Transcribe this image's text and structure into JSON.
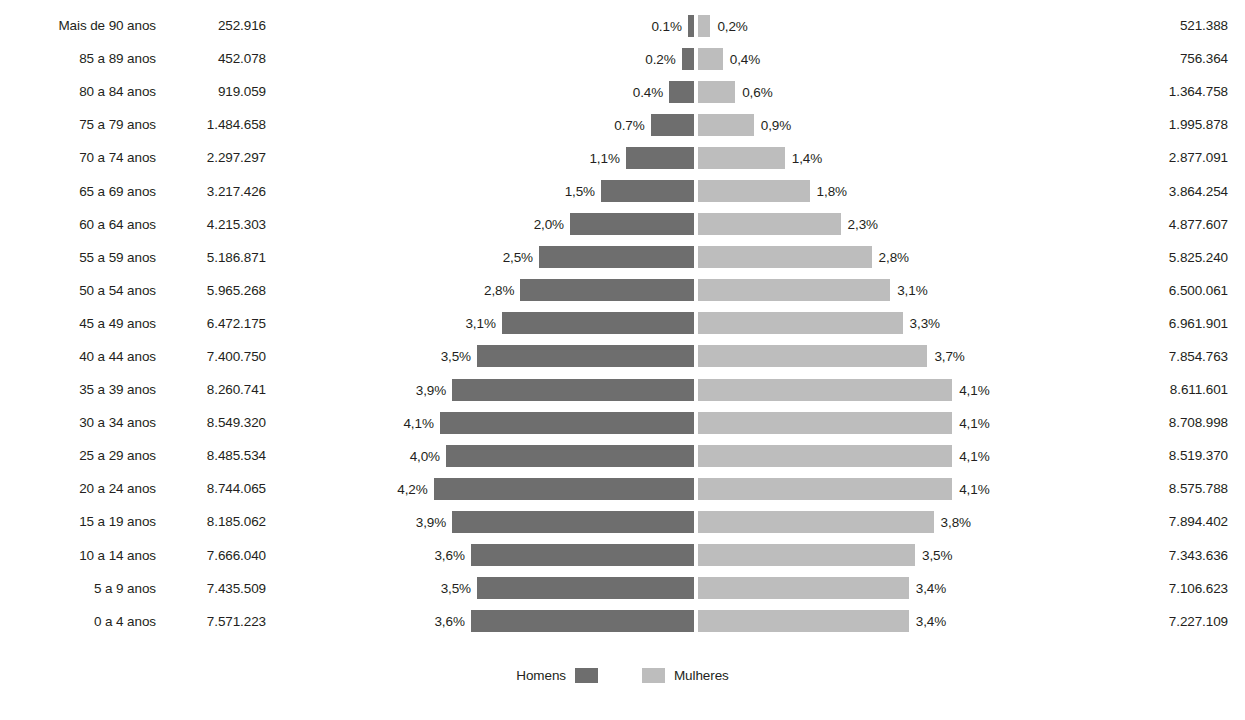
{
  "legend": {
    "men_label": "Homens",
    "women_label": "Mulheres",
    "men_color": "#6e6e6e",
    "women_color": "#bdbdbd"
  },
  "chart_data": {
    "type": "bar",
    "subtype": "population-pyramid",
    "title": "",
    "xlabel": "",
    "ylabel": "",
    "grid": false,
    "legend_position": "bottom-center",
    "center_axis_px": 696,
    "px_per_percent": 62.0,
    "xlim": [
      -4.5,
      4.5
    ],
    "categories": [
      "Mais de 90 anos",
      "85 a 89 anos",
      "80 a 84 anos",
      "75 a 79 anos",
      "70 a 74 anos",
      "65 a 69 anos",
      "60 a 64 anos",
      "55 a 59 anos",
      "50 a 54 anos",
      "45 a 49 anos",
      "40 a 44 anos",
      "35 a 39 anos",
      "30 a 34 anos",
      "25 a 29 anos",
      "20 a 24 anos",
      "15 a 19 anos",
      "10 a 14 anos",
      "5 a 9 anos",
      "0 a 4 anos"
    ],
    "series": [
      {
        "name": "Homens",
        "side": "left",
        "color": "#6e6e6e",
        "counts_text": [
          "252.916",
          "452.078",
          "919.059",
          "1.484.658",
          "2.297.297",
          "3.217.426",
          "4.215.303",
          "5.186.871",
          "5.965.268",
          "6.472.175",
          "7.400.750",
          "8.260.741",
          "8.549.320",
          "8.485.534",
          "8.744.065",
          "8.185.062",
          "7.666.040",
          "7.435.509",
          "7.571.223"
        ],
        "counts": [
          252916,
          452078,
          919059,
          1484658,
          2297297,
          3217426,
          4215303,
          5186871,
          5965268,
          6472175,
          7400750,
          8260741,
          8549320,
          8485534,
          8744065,
          8185062,
          7666040,
          7435509,
          7571223
        ],
        "percent_text": [
          "0.1%",
          "0.2%",
          "0.4%",
          "0.7%",
          "1,1%",
          "1,5%",
          "2,0%",
          "2,5%",
          "2,8%",
          "3,1%",
          "3,5%",
          "3,9%",
          "4,1%",
          "4,0%",
          "4,2%",
          "3,9%",
          "3,6%",
          "3,5%",
          "3,6%"
        ],
        "percent": [
          0.1,
          0.2,
          0.4,
          0.7,
          1.1,
          1.5,
          2.0,
          2.5,
          2.8,
          3.1,
          3.5,
          3.9,
          4.1,
          4.0,
          4.2,
          3.9,
          3.6,
          3.5,
          3.6
        ]
      },
      {
        "name": "Mulheres",
        "side": "right",
        "color": "#bdbdbd",
        "counts_text": [
          "521.388",
          "756.364",
          "1.364.758",
          "1.995.878",
          "2.877.091",
          "3.864.254",
          "4.877.607",
          "5.825.240",
          "6.500.061",
          "6.961.901",
          "7.854.763",
          "8.611.601",
          "8.708.998",
          "8.519.370",
          "8.575.788",
          "7.894.402",
          "7.343.636",
          "7.106.623",
          "7.227.109"
        ],
        "counts": [
          521388,
          756364,
          1364758,
          1995878,
          2877091,
          3864254,
          4877607,
          5825240,
          6500061,
          6961901,
          7854763,
          8611601,
          8708998,
          8519370,
          8575788,
          7894402,
          7343636,
          7106623,
          7227109
        ],
        "percent_text": [
          "0,2%",
          "0,4%",
          "0,6%",
          "0,9%",
          "1,4%",
          "1,8%",
          "2,3%",
          "2,8%",
          "3,1%",
          "3,3%",
          "3,7%",
          "4,1%",
          "4,1%",
          "4,1%",
          "4,1%",
          "3,8%",
          "3,5%",
          "3,4%",
          "3,4%"
        ],
        "percent": [
          0.2,
          0.4,
          0.6,
          0.9,
          1.4,
          1.8,
          2.3,
          2.8,
          3.1,
          3.3,
          3.7,
          4.1,
          4.1,
          4.1,
          4.1,
          3.8,
          3.5,
          3.4,
          3.4
        ]
      }
    ]
  }
}
